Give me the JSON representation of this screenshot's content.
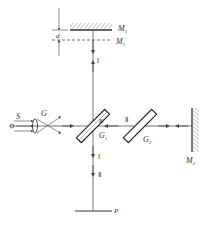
{
  "diagram": {
    "labels": {
      "M1": {
        "main": "M",
        "sub": "1"
      },
      "M1_prime": {
        "main": "M",
        "sub": "1",
        "prime": "′"
      },
      "M2": {
        "main": "M",
        "sub": "2"
      },
      "G1": {
        "main": "G",
        "sub": "1"
      },
      "G2": {
        "main": "G",
        "sub": "2"
      },
      "d": "d",
      "S": "S",
      "G": "G",
      "K": "K",
      "P": "P",
      "beam1_upper": "Ⅰ",
      "beam1_lower": "Ⅰ",
      "beam2_horizontal": "Ⅱ",
      "beam2_lower": "Ⅱ"
    },
    "colors": {
      "line": "#444444",
      "background": "#ffffff"
    }
  }
}
